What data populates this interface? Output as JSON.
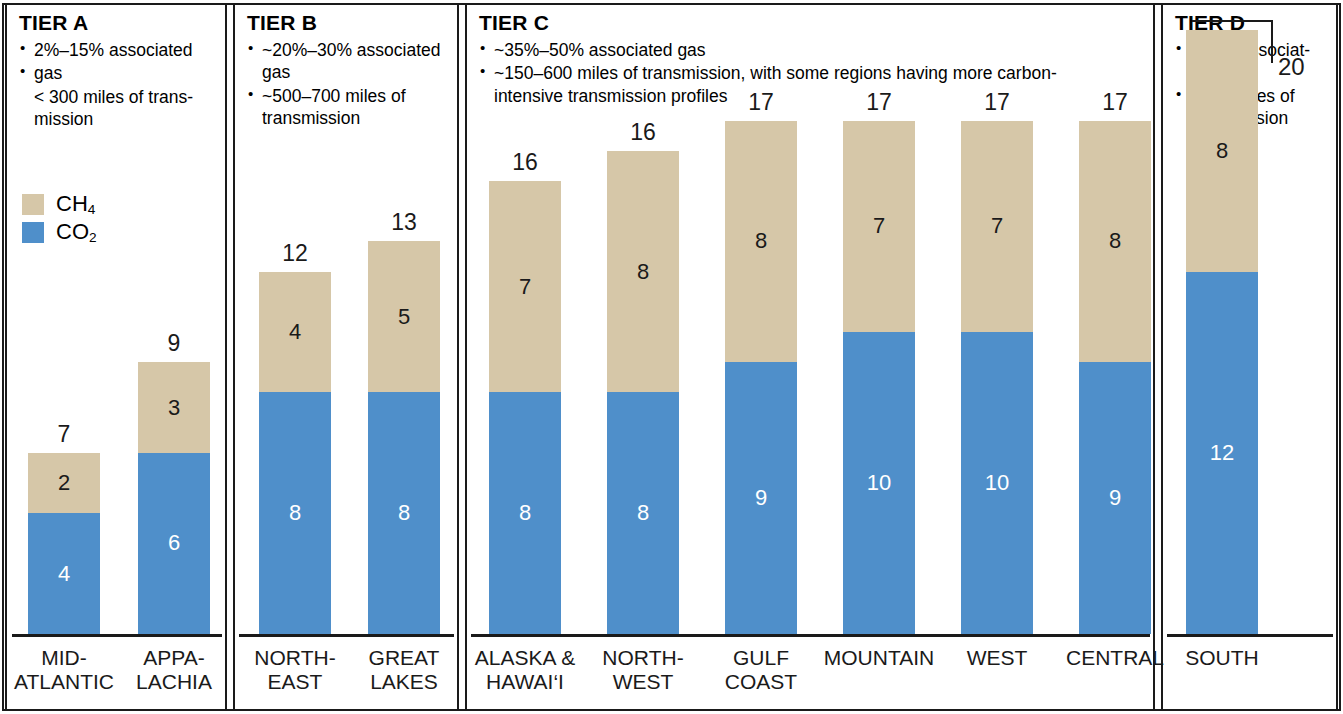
{
  "colors": {
    "ch4": "#d6c7a8",
    "co2": "#4f8fca",
    "frame": "#1a1a1a",
    "background": "#ffffff"
  },
  "legend": {
    "items": [
      {
        "key": "ch4",
        "label": "CH",
        "sub": "4",
        "color": "#d6c7a8"
      },
      {
        "key": "co2",
        "label": "CO",
        "sub": "2",
        "color": "#4f8fca"
      }
    ]
  },
  "tiers": [
    {
      "id": "tier-a",
      "title": "TIER A",
      "bullets": [
        {
          "bullet": true,
          "text": "2%–15% associated"
        },
        {
          "bullet": true,
          "text": "gas"
        },
        {
          "bullet": false,
          "text": "< 300 miles of trans-\nmission"
        }
      ]
    },
    {
      "id": "tier-b",
      "title": "TIER B",
      "bullets": [
        {
          "bullet": true,
          "text": "~20%–30% associated\ngas"
        },
        {
          "bullet": true,
          "text": "~500–700 miles of\ntransmission"
        }
      ]
    },
    {
      "id": "tier-c",
      "title": "TIER C",
      "bullets": [
        {
          "bullet": true,
          "text": "~35%–50% associated gas"
        },
        {
          "bullet": true,
          "text": "~150–600 miles of transmission, with some regions having more carbon-\nintensive transmission profiles"
        }
      ]
    },
    {
      "id": "tier-d",
      "title": "TIER D",
      "bullets": [
        {
          "bullet": true,
          "text": "~60% associat-\ned gas"
        },
        {
          "bullet": true,
          "text": "~900 miles of\ntransmission"
        }
      ]
    }
  ],
  "callout": {
    "value": "20",
    "for_category": "SOUTH"
  },
  "chart_data": {
    "type": "bar",
    "subtype": "stacked",
    "title": "",
    "xlabel": "",
    "ylabel": "",
    "ylim": [
      0,
      20
    ],
    "grid": false,
    "legend_position": "upper-left",
    "stack_order": [
      "CO2",
      "CH4"
    ],
    "categories": [
      "MID-\nATLANTIC",
      "APPA-\nLACHIA",
      "NORTH-\nEAST",
      "GREAT\nLAKES",
      "ALASKA &\nHAWAI‘I",
      "NORTH-\nWEST",
      "GULF\nCOAST",
      "MOUNTAIN",
      "WEST",
      "CENTRAL",
      "SOUTH"
    ],
    "series": [
      {
        "name": "CO2",
        "color": "#4f8fca",
        "values": [
          4,
          6,
          8,
          8,
          8,
          8,
          9,
          10,
          10,
          9,
          12
        ]
      },
      {
        "name": "CH4",
        "color": "#d6c7a8",
        "values": [
          2,
          3,
          4,
          5,
          7,
          8,
          8,
          7,
          7,
          8,
          8
        ]
      }
    ],
    "totals": [
      7,
      9,
      12,
      13,
      16,
      16,
      17,
      17,
      17,
      17,
      20
    ],
    "tier_of_category": [
      "TIER A",
      "TIER A",
      "TIER B",
      "TIER B",
      "TIER C",
      "TIER C",
      "TIER C",
      "TIER C",
      "TIER C",
      "TIER C",
      "TIER D"
    ]
  },
  "layout": {
    "panels": [
      {
        "id": "tier-a",
        "left": 5,
        "width": 222
      },
      {
        "id": "tier-b",
        "left": 233,
        "width": 226
      },
      {
        "id": "tier-c",
        "left": 465,
        "width": 690
      },
      {
        "id": "tier-d",
        "left": 1161,
        "width": 177
      }
    ],
    "axes": [
      {
        "left": 12,
        "width": 210
      },
      {
        "left": 239,
        "width": 215
      },
      {
        "left": 471,
        "width": 679
      },
      {
        "left": 1167,
        "width": 166
      }
    ],
    "axis_y": 634,
    "label_y": 646,
    "bar_width": 72,
    "unit_px": 30.2,
    "bars": [
      {
        "center": 64,
        "category_index": 0
      },
      {
        "center": 174,
        "category_index": 1
      },
      {
        "center": 295,
        "category_index": 2
      },
      {
        "center": 404,
        "category_index": 3
      },
      {
        "center": 525,
        "category_index": 4
      },
      {
        "center": 643,
        "category_index": 5
      },
      {
        "center": 761,
        "category_index": 6
      },
      {
        "center": 879,
        "category_index": 7
      },
      {
        "center": 997,
        "category_index": 8
      },
      {
        "center": 1115,
        "category_index": 9
      },
      {
        "center": 1222,
        "category_index": 10
      }
    ]
  }
}
